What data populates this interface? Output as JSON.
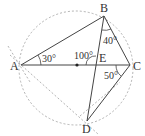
{
  "figure": {
    "type": "geometry-circle-inscribed-quadrilateral",
    "points": {
      "A": {
        "label": "A",
        "x": 21,
        "y": 65
      },
      "B": {
        "label": "B",
        "x": 104,
        "y": 16
      },
      "C": {
        "label": "C",
        "x": 130,
        "y": 65
      },
      "D": {
        "label": "D",
        "x": 87,
        "y": 121
      },
      "E": {
        "label": "E",
        "x": 95,
        "y": 65
      },
      "O": {
        "label": "",
        "x": 77,
        "y": 65
      }
    },
    "angles": {
      "BAC": "30°",
      "AEB": "100°",
      "ABD": "40°",
      "ACD": "50°"
    },
    "colors": {
      "line": "#444444",
      "circle": "#999999",
      "text": "#333333"
    }
  }
}
